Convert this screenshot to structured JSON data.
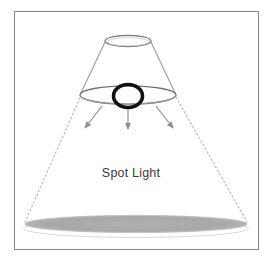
{
  "figure": {
    "title": "Spot Light",
    "label": "Spot Light",
    "frame": {
      "name": "outer-border",
      "x": 14,
      "y": 11,
      "width": 245,
      "height": 239,
      "stroke": "#8a8a8a",
      "fill": "#ffffff"
    },
    "background_color": "#ffffff",
    "colors": {
      "frame_stroke": "#8a8a8a",
      "ellipse_stroke": "#6f6f6f",
      "cone_line": "#9a9a9a",
      "dashed_line": "#b9b9b9",
      "arrow": "#8d8d8d",
      "lamp_ring": "#111111",
      "pool_fill": "#a6a6a6",
      "pool_highlight": "#ffffff",
      "text": "#3a3a3a"
    },
    "elements": {
      "top_ellipse": {
        "name": "top-ellipse",
        "cx": 128,
        "cy": 41,
        "rx": 23,
        "ry": 5.5,
        "description": "small open ellipse at top of cone"
      },
      "shade_ellipse": {
        "name": "lamp-shade-ellipse",
        "cx": 128,
        "cy": 95,
        "rx": 48,
        "ry": 9,
        "description": "large open ellipse forming the lamp shade rim"
      },
      "lamp_ring": {
        "name": "lamp-bulb-ring",
        "cx": 128,
        "cy": 96,
        "rx": 15,
        "ry": 12,
        "stroke_width": 4,
        "description": "thick black ring representing the spot light source"
      },
      "light_pool": {
        "name": "light-pool-ellipse",
        "cx": 136,
        "cy": 224,
        "rx": 112,
        "ry": 9,
        "description": "shaded ellipse where the spot light lands"
      },
      "light_pool_highlight": {
        "name": "light-pool-highlight",
        "cx": 136,
        "cy": 228,
        "rx": 112,
        "ry": 9
      }
    },
    "cone_lines": [
      {
        "name": "cone-line-left",
        "x1": 105,
        "y1": 42,
        "x2": 80,
        "y2": 94
      },
      {
        "name": "cone-line-right",
        "x1": 151,
        "y1": 42,
        "x2": 176,
        "y2": 94
      }
    ],
    "dashed_beam_lines": [
      {
        "name": "beam-dashed-left",
        "x1": 80,
        "y1": 98,
        "x2": 25,
        "y2": 222
      },
      {
        "name": "beam-dashed-right",
        "x1": 176,
        "y1": 97,
        "x2": 247,
        "y2": 222
      }
    ],
    "arrows": [
      {
        "name": "light-arrow-left",
        "x1": 102,
        "y1": 107,
        "x2": 84,
        "y2": 130,
        "label": "left beam arrow"
      },
      {
        "name": "light-arrow-center",
        "x1": 128,
        "y1": 108,
        "x2": 128,
        "y2": 131,
        "label": "center beam arrow"
      },
      {
        "name": "light-arrow-right",
        "x1": 156,
        "y1": 107,
        "x2": 174,
        "y2": 130,
        "label": "right beam arrow"
      }
    ],
    "caption": {
      "name": "spot-light-caption",
      "text": "Spot Light",
      "x": 131,
      "y": 176,
      "anchor": "middle",
      "font_size": 12.5
    }
  }
}
